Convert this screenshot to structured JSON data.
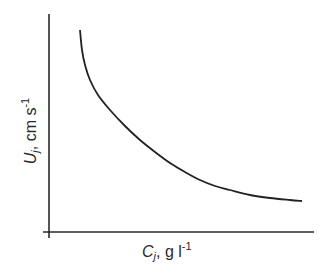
{
  "chart_data": {
    "type": "line",
    "title": "",
    "xlabel": "C_j, g l^-1",
    "ylabel": "U_j, cm s^-1",
    "xlabel_parts": {
      "symbol": "C",
      "subscript": "j",
      "unit": ", g l",
      "superscript": "-1"
    },
    "ylabel_parts": {
      "symbol": "U",
      "subscript": "j",
      "unit": ", cm s",
      "superscript": "-1"
    },
    "x_ticks": [],
    "y_ticks": [],
    "grid": false,
    "legend": null,
    "series": [
      {
        "name": "U_j vs C_j",
        "points_px": [
          [
            80,
            30
          ],
          [
            82,
            50
          ],
          [
            85,
            65
          ],
          [
            90,
            80
          ],
          [
            98,
            95
          ],
          [
            110,
            110
          ],
          [
            125,
            126
          ],
          [
            140,
            140
          ],
          [
            155,
            152
          ],
          [
            170,
            163
          ],
          [
            185,
            172
          ],
          [
            200,
            180
          ],
          [
            215,
            186
          ],
          [
            230,
            190
          ],
          [
            250,
            195
          ],
          [
            270,
            198
          ],
          [
            290,
            200
          ],
          [
            302,
            201
          ]
        ]
      }
    ],
    "axes_px": {
      "origin": [
        49,
        232
      ],
      "y_axis_top": [
        49,
        14
      ],
      "y_axis_bottom": [
        49,
        238
      ],
      "x_axis_left": [
        43,
        232
      ],
      "x_axis_right": [
        314,
        232
      ]
    }
  }
}
